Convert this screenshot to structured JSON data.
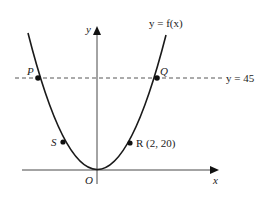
{
  "diagram": {
    "type": "graph-of-function",
    "curve_label": "y = f(x)",
    "axes": {
      "x_label": "x",
      "y_label": "y",
      "origin_label": "O"
    },
    "horizontal_line": {
      "label": "y = 45",
      "style": "dashed"
    },
    "points": [
      {
        "name": "P",
        "label": "P"
      },
      {
        "name": "Q",
        "label": "Q"
      },
      {
        "name": "S",
        "label": "S"
      },
      {
        "name": "R",
        "label": "R (2, 20)"
      }
    ]
  },
  "colors": {
    "stroke": "#1a1a1a",
    "background": "#ffffff"
  }
}
